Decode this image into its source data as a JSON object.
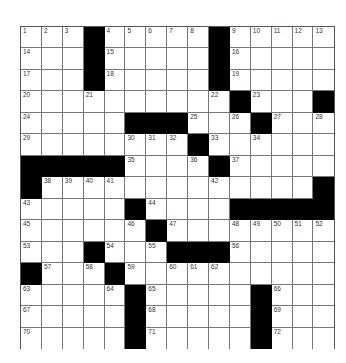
{
  "puzzle": {
    "rows": 15,
    "cols": 15,
    "colors": {
      "black": "#000000",
      "white": "#ffffff",
      "line": "#777777"
    },
    "grid": [
      [
        "1",
        "2",
        "3",
        "#",
        "4",
        "5",
        "6",
        "7",
        "8",
        "#",
        "9",
        "10",
        "11",
        "12",
        "13"
      ],
      [
        "14",
        "",
        "",
        "#",
        "15",
        "",
        "",
        "",
        "",
        "#",
        "16",
        "",
        "",
        "",
        ""
      ],
      [
        "17",
        "",
        "",
        "#",
        "18",
        "",
        "",
        "",
        "",
        "#",
        "19",
        "",
        "",
        "",
        ""
      ],
      [
        "20",
        "",
        "",
        "21",
        "",
        "",
        "",
        "",
        "",
        "22",
        "#",
        "23",
        "",
        "",
        "#"
      ],
      [
        "24",
        "",
        "",
        "",
        "",
        "#",
        "#",
        "#",
        "25",
        "",
        "26",
        "#",
        "27",
        "",
        "28"
      ],
      [
        "29",
        "",
        "",
        "",
        "",
        "30",
        "31",
        "32",
        "#",
        "33",
        "",
        "34",
        "",
        "",
        ""
      ],
      [
        "#",
        "#",
        "#",
        "#",
        "#",
        "35",
        "",
        "",
        "36",
        "#",
        "37",
        "",
        "",
        "",
        ""
      ],
      [
        "#",
        "38",
        "39",
        "40",
        "41",
        "",
        "",
        "",
        "",
        "42",
        "",
        "",
        "",
        "",
        "#"
      ],
      [
        "43",
        "",
        "",
        "",
        "",
        "#",
        "44",
        "",
        "",
        "",
        "#",
        "#",
        "#",
        "#",
        "#"
      ],
      [
        "45",
        "",
        "",
        "",
        "",
        "46",
        "#",
        "47",
        "",
        "",
        "48",
        "49",
        "50",
        "51",
        "52"
      ],
      [
        "53",
        "",
        "",
        "#",
        "54",
        "",
        "55",
        "#",
        "#",
        "#",
        "56",
        "",
        "",
        "",
        ""
      ],
      [
        "#",
        "57",
        "",
        "58",
        "#",
        "59",
        "",
        "60",
        "61",
        "62",
        "",
        "",
        "",
        "",
        ""
      ],
      [
        "63",
        "",
        "",
        "",
        "64",
        "#",
        "65",
        "",
        "",
        "",
        "",
        "#",
        "66",
        "",
        ""
      ],
      [
        "67",
        "",
        "",
        "",
        "",
        "#",
        "68",
        "",
        "",
        "",
        "",
        "#",
        "69",
        "",
        ""
      ],
      [
        "70",
        "",
        "",
        "",
        "",
        "#",
        "71",
        "",
        "",
        "",
        "",
        "#",
        "72",
        "",
        ""
      ]
    ]
  }
}
